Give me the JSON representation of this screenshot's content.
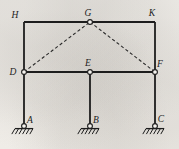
{
  "figure": {
    "kind": "structural-frame-diagram",
    "width": 179,
    "height": 149,
    "background_color": "#f4f2ee",
    "member_color": "#1d1d1d",
    "dashed_color": "#2a2a2a",
    "label_color": "#1d1d1d"
  },
  "nodes": [
    {
      "id": "H",
      "label": "H",
      "x": 24,
      "y": 22,
      "marker": "none",
      "label_dx": -9,
      "label_dy": -4
    },
    {
      "id": "G",
      "label": "G",
      "x": 90,
      "y": 22,
      "marker": "circle",
      "label_dx": -2,
      "label_dy": -6
    },
    {
      "id": "K",
      "label": "K",
      "x": 155,
      "y": 22,
      "marker": "none",
      "label_dx": -3,
      "label_dy": -6
    },
    {
      "id": "D",
      "label": "D",
      "x": 24,
      "y": 72,
      "marker": "circle",
      "label_dx": -11,
      "label_dy": 3
    },
    {
      "id": "E",
      "label": "E",
      "x": 90,
      "y": 72,
      "marker": "circle",
      "label_dx": -2,
      "label_dy": -6
    },
    {
      "id": "F",
      "label": "F",
      "x": 155,
      "y": 72,
      "marker": "circle",
      "label_dx": 5,
      "label_dy": -5
    },
    {
      "id": "A",
      "label": "A",
      "x": 24,
      "y": 126,
      "marker": "circle",
      "label_dx": 6,
      "label_dy": -3
    },
    {
      "id": "B",
      "label": "B",
      "x": 90,
      "y": 126,
      "marker": "circle",
      "label_dx": 6,
      "label_dy": -3
    },
    {
      "id": "C",
      "label": "C",
      "x": 155,
      "y": 126,
      "marker": "circle",
      "label_dx": 6,
      "label_dy": -4
    }
  ],
  "members": [
    {
      "id": "HG",
      "from": "H",
      "to": "G",
      "style": "solid",
      "kind": "beam"
    },
    {
      "id": "GK",
      "from": "G",
      "to": "K",
      "style": "solid",
      "kind": "beam"
    },
    {
      "id": "HD",
      "from": "H",
      "to": "D",
      "style": "solid",
      "kind": "column"
    },
    {
      "id": "KF",
      "from": "K",
      "to": "F",
      "style": "solid",
      "kind": "column"
    },
    {
      "id": "DE",
      "from": "D",
      "to": "E",
      "style": "solid",
      "kind": "beam"
    },
    {
      "id": "EF",
      "from": "E",
      "to": "F",
      "style": "solid",
      "kind": "beam"
    },
    {
      "id": "DA",
      "from": "D",
      "to": "A",
      "style": "solid",
      "kind": "column"
    },
    {
      "id": "EB",
      "from": "E",
      "to": "B",
      "style": "solid",
      "kind": "column"
    },
    {
      "id": "FC",
      "from": "F",
      "to": "C",
      "style": "solid",
      "kind": "column"
    },
    {
      "id": "DG",
      "from": "D",
      "to": "G",
      "style": "dashed",
      "kind": "brace"
    },
    {
      "id": "GF",
      "from": "G",
      "to": "F",
      "style": "dashed",
      "kind": "brace"
    }
  ],
  "supports": [
    {
      "id": "support-A",
      "node": "A",
      "type": "pinned",
      "ground_half_width": 9,
      "hatch_count": 5
    },
    {
      "id": "support-B",
      "node": "B",
      "type": "pinned",
      "ground_half_width": 9,
      "hatch_count": 5
    },
    {
      "id": "support-C",
      "node": "C",
      "type": "pinned",
      "ground_half_width": 9,
      "hatch_count": 5
    }
  ],
  "style": {
    "member_width": 1.8,
    "dash_pattern": "3.2 2.4",
    "dash_width": 1.1,
    "node_radius": 2.4,
    "node_fill": "#f4f2ee",
    "node_stroke_width": 1.1,
    "ground_line_width": 1.3,
    "hatch_width": 1.0,
    "hatch_len": 5.5,
    "hatch_angle_dx": -3.2
  }
}
